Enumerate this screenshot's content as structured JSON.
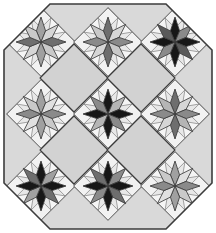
{
  "artwork": {
    "title": "Eight-Pointed Star Patchwork Quilt",
    "style": "LeMoyne star blocks set on point with cut corners (octagon outline)",
    "canvas": {
      "width": 216,
      "height": 233
    },
    "background_color": "#ffffff"
  },
  "palette": {
    "background": "#ffffff",
    "sashing_light": "#d9d9d9",
    "sashing_light_alt": "#d2d2d2",
    "block_field": "#e8e8e8",
    "corner_square": "#f2f2f2",
    "star_white": "#f5f5f5",
    "star_light_gray": "#c9c9c9",
    "star_mid_gray": "#a0a0a0",
    "star_dark_gray": "#6e6e6e",
    "star_black": "#171717",
    "outline": "#3c3c3c",
    "outline_soft": "#808080"
  },
  "geometry": {
    "grid_rows": 3,
    "grid_cols": 3,
    "block_pitch_x": 67,
    "block_pitch_y": 72,
    "block_half_diagonal": 34,
    "star_outer_radius": 25,
    "star_inner_radius": 12,
    "star_points": 8,
    "octagon_corner_cut": 46,
    "outer_margin": 4
  },
  "blocks": [
    {
      "id": "block-r1c1",
      "row": 1,
      "col": 1,
      "name": "star-top-left",
      "center": {
        "x": 41,
        "y": 42
      },
      "tone": "medium",
      "diamond_colors": [
        "#a0a0a0",
        "#d6d6d6",
        "#6e6e6e",
        "#c9c9c9",
        "#a0a0a0",
        "#d6d6d6",
        "#6e6e6e",
        "#c9c9c9"
      ]
    },
    {
      "id": "block-r1c2",
      "row": 1,
      "col": 2,
      "name": "star-top-center",
      "center": {
        "x": 108,
        "y": 42
      },
      "tone": "medium-dark",
      "diamond_colors": [
        "#6e6e6e",
        "#d6d6d6",
        "#8a8a8a",
        "#c9c9c9",
        "#6e6e6e",
        "#d6d6d6",
        "#8a8a8a",
        "#c9c9c9"
      ]
    },
    {
      "id": "block-r1c3",
      "row": 1,
      "col": 3,
      "name": "star-top-right",
      "center": {
        "x": 175,
        "y": 42
      },
      "tone": "dark",
      "diamond_colors": [
        "#171717",
        "#8a8a8a",
        "#171717",
        "#5a5a5a",
        "#171717",
        "#8a8a8a",
        "#171717",
        "#5a5a5a"
      ]
    },
    {
      "id": "block-r2c1",
      "row": 2,
      "col": 1,
      "name": "star-middle-left",
      "center": {
        "x": 41,
        "y": 114
      },
      "tone": "light",
      "diamond_colors": [
        "#a0a0a0",
        "#e0e0e0",
        "#8a8a8a",
        "#c9c9c9",
        "#a0a0a0",
        "#e0e0e0",
        "#8a8a8a",
        "#c9c9c9"
      ]
    },
    {
      "id": "block-r2c2",
      "row": 2,
      "col": 2,
      "name": "star-center",
      "center": {
        "x": 108,
        "y": 114
      },
      "tone": "dark",
      "diamond_colors": [
        "#171717",
        "#b5b5b5",
        "#171717",
        "#8a8a8a",
        "#171717",
        "#b5b5b5",
        "#171717",
        "#8a8a8a"
      ]
    },
    {
      "id": "block-r2c3",
      "row": 2,
      "col": 3,
      "name": "star-middle-right",
      "center": {
        "x": 175,
        "y": 114
      },
      "tone": "medium",
      "diamond_colors": [
        "#6e6e6e",
        "#d6d6d6",
        "#8a8a8a",
        "#b5b5b5",
        "#6e6e6e",
        "#d6d6d6",
        "#8a8a8a",
        "#b5b5b5"
      ]
    },
    {
      "id": "block-r3c1",
      "row": 3,
      "col": 1,
      "name": "star-bottom-left",
      "center": {
        "x": 41,
        "y": 186
      },
      "tone": "dark",
      "diamond_colors": [
        "#171717",
        "#a0a0a0",
        "#171717",
        "#6e6e6e",
        "#171717",
        "#a0a0a0",
        "#171717",
        "#6e6e6e"
      ]
    },
    {
      "id": "block-r3c2",
      "row": 3,
      "col": 2,
      "name": "star-bottom-center",
      "center": {
        "x": 108,
        "y": 186
      },
      "tone": "dark",
      "diamond_colors": [
        "#171717",
        "#8a8a8a",
        "#171717",
        "#6e6e6e",
        "#171717",
        "#8a8a8a",
        "#171717",
        "#6e6e6e"
      ]
    },
    {
      "id": "block-r3c3",
      "row": 3,
      "col": 3,
      "name": "star-bottom-right",
      "center": {
        "x": 175,
        "y": 186
      },
      "tone": "light",
      "diamond_colors": [
        "#a0a0a0",
        "#e0e0e0",
        "#8a8a8a",
        "#c9c9c9",
        "#a0a0a0",
        "#e0e0e0",
        "#8a8a8a",
        "#c9c9c9"
      ]
    }
  ],
  "setting_squares": [
    {
      "id": "setting-r1c1r2",
      "name": "plain-diamond-upper-left",
      "center": {
        "x": 74,
        "y": 78
      }
    },
    {
      "id": "setting-r1c2r2",
      "name": "plain-diamond-upper-right",
      "center": {
        "x": 141,
        "y": 78
      }
    },
    {
      "id": "setting-r2c1r3",
      "name": "plain-diamond-lower-left",
      "center": {
        "x": 74,
        "y": 150
      }
    },
    {
      "id": "setting-r2c2r3",
      "name": "plain-diamond-lower-right",
      "center": {
        "x": 141,
        "y": 150
      }
    }
  ]
}
